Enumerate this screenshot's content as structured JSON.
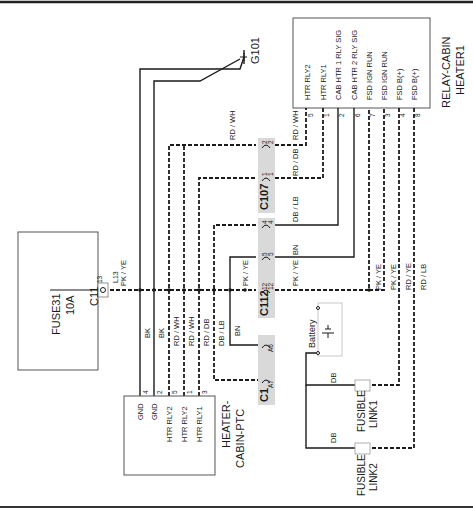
{
  "diagram": {
    "ground": {
      "id": "G101"
    },
    "relay": {
      "name_line1": "RELAY-CABIN",
      "name_line2": "HEATER1",
      "pins": [
        {
          "num": "5",
          "label": "HTR RLY2"
        },
        {
          "num": "1",
          "label": "HTR RLY1"
        },
        {
          "num": "2",
          "label": "CAB HTR 1 RLY SIG"
        },
        {
          "num": "6",
          "label": "CAB HTR 2 RLY SIG"
        },
        {
          "num": "7",
          "label": "FSD IGN RUN"
        },
        {
          "num": "3",
          "label": "FSD IGN RUN"
        },
        {
          "num": "4",
          "label": "FSD B(+)"
        },
        {
          "num": "8",
          "label": "FSD B(+)"
        }
      ],
      "wire_colors": [
        "RD / WH",
        "RD / DB",
        "DB / LB",
        "BN",
        "PK / YE",
        "PK / YE",
        "RD / YE",
        "RD / LB"
      ]
    },
    "fuse": {
      "name_line1": "FUSE31",
      "name_line2": "10A",
      "connector": "C11",
      "pin": "13",
      "terminal": "L13",
      "wire": "PK / YE"
    },
    "connectors": {
      "c107": {
        "name": "C107",
        "pins": [
          "2",
          "1"
        ]
      },
      "c112": {
        "name": "C112",
        "pins": [
          "4",
          "5",
          "12"
        ]
      },
      "c1": {
        "name": "C1",
        "pins": [
          "A6",
          "A7"
        ]
      }
    },
    "heater": {
      "name_line1": "HEATER-",
      "name_line2": "CABIN-PTC",
      "pins": [
        {
          "num": "4",
          "label": "GND",
          "wire": "BK"
        },
        {
          "num": "2",
          "label": "GND",
          "wire": "BK"
        },
        {
          "num": "5",
          "label": "HTR RLY2",
          "wire": "RD / WH"
        },
        {
          "num": "1",
          "label": "HTR RLY2",
          "wire": "RD / WH"
        },
        {
          "num": "3",
          "label": "HTR RLY1",
          "wire": "RD / DB"
        }
      ]
    },
    "wires": {
      "db_lb": "DB / LB",
      "bn": "BN",
      "rd_wh_top": "RD / WH",
      "pk_ye_mid": "PK / YE",
      "pk_ye_right": "PK / YE",
      "db_1": "DB",
      "db_2": "DB"
    },
    "battery": {
      "label": "Battery"
    },
    "fusible_link1": {
      "line1": "FUSIBLE",
      "line2": "LINK1"
    },
    "fusible_link2": {
      "line1": "FUSIBLE",
      "line2": "LINK2"
    }
  }
}
